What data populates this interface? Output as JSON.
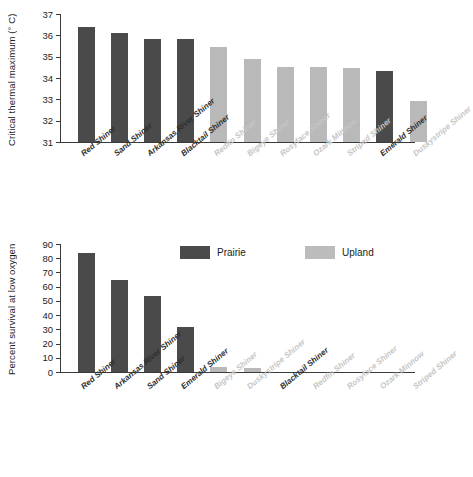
{
  "chart_data": [
    {
      "panel": "top",
      "type": "bar",
      "title": "",
      "xlabel": "",
      "ylabel": "Critical thermal maximum (° C)",
      "ylim": [
        31,
        37
      ],
      "yticks": [
        31,
        32,
        33,
        34,
        35,
        36,
        37
      ],
      "ytick_labels": [
        "31",
        "32",
        "33",
        "34",
        "35",
        "36",
        "37"
      ],
      "grid": false,
      "legend": "none",
      "categories": [
        "Red Shiner",
        "Sand Shiner",
        "Arkansas River Shiner",
        "Blacktail Shiner",
        "Redfin Shiner",
        "Bigeye Shiner",
        "Rosyface Shiner",
        "Ozark Minnow",
        "Striped Shiner",
        "Emerald Shiner",
        "Duskystripe Shiner"
      ],
      "values": [
        36.4,
        36.1,
        35.85,
        35.85,
        35.45,
        34.9,
        34.5,
        34.5,
        34.45,
        34.35,
        32.9
      ],
      "groups": [
        "Prairie",
        "Prairie",
        "Prairie",
        "Prairie",
        "Upland",
        "Upland",
        "Upland",
        "Upland",
        "Upland",
        "Prairie",
        "Upland"
      ]
    },
    {
      "panel": "bottom",
      "type": "bar",
      "title": "",
      "xlabel": "",
      "ylabel": "Percent survival at low oxygen",
      "ylim": [
        0,
        90
      ],
      "yticks": [
        0,
        10,
        20,
        30,
        40,
        50,
        60,
        70,
        80,
        90
      ],
      "ytick_labels": [
        "0",
        "10",
        "20",
        "30",
        "40",
        "50",
        "60",
        "70",
        "80",
        "90"
      ],
      "grid": false,
      "legend": "inside-top",
      "categories": [
        "Red Shiner",
        "Arkansas River Shiner",
        "Sand Shiner",
        "Emerald Shiner",
        "Bigeye Shiner",
        "Duskystripe Shiner",
        "Blacktail Shiner",
        "Redfin Shiner",
        "Rosyface Shiner",
        "Ozark Minnow",
        "Striped Shiner"
      ],
      "values": [
        84,
        64.5,
        53.5,
        32,
        3.5,
        2.5,
        0,
        0,
        0,
        0,
        0
      ],
      "groups": [
        "Prairie",
        "Prairie",
        "Prairie",
        "Prairie",
        "Upland",
        "Upland",
        "Prairie",
        "Upland",
        "Upland",
        "Upland",
        "Upland"
      ]
    }
  ],
  "legend": {
    "entries": [
      {
        "label": "Prairie",
        "color": "#4a4a4a",
        "key": "prairie"
      },
      {
        "label": "Upland",
        "color": "#bcbcbc",
        "key": "upland"
      }
    ]
  },
  "colors": {
    "prairie": "#4a4a4a",
    "upland": "#b9b9b9",
    "axis": "#3a3a3a",
    "text": "#1c1c1c",
    "label_upland": "#c6c6c6",
    "background": "#ffffff"
  }
}
